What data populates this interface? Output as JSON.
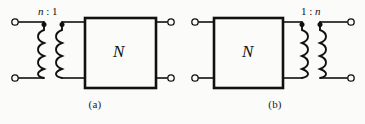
{
  "figure": {
    "background_color": "#fbfbfa",
    "ink_color": "#111111",
    "width": 365,
    "height": 124,
    "kind": "circuit-diagram"
  },
  "panel_a": {
    "caption": "(a)",
    "turns_ratio": "n : 1",
    "turns_ratio_left": "n",
    "turns_ratio_separator": ":",
    "turns_ratio_right": "1",
    "network_label": "N",
    "transformer_position": "left",
    "network_position": "right",
    "dot_count": 2,
    "coil_bumps": 4,
    "terminals": [
      {
        "name": "input-top",
        "x": 15,
        "y": 22
      },
      {
        "name": "input-bottom",
        "x": 15,
        "y": 78
      },
      {
        "name": "output-top",
        "x": 171,
        "y": 22
      },
      {
        "name": "output-bottom",
        "x": 171,
        "y": 78
      }
    ]
  },
  "panel_b": {
    "caption": "(b)",
    "turns_ratio": "1 : n",
    "turns_ratio_left": "1",
    "turns_ratio_separator": ":",
    "turns_ratio_right": "n",
    "network_label": "N",
    "transformer_position": "right",
    "network_position": "left",
    "dot_count": 2,
    "coil_bumps": 4,
    "terminals": [
      {
        "name": "input-top",
        "x": 195,
        "y": 22
      },
      {
        "name": "input-bottom",
        "x": 195,
        "y": 78
      },
      {
        "name": "output-top",
        "x": 351,
        "y": 22
      },
      {
        "name": "output-bottom",
        "x": 351,
        "y": 78
      }
    ]
  }
}
